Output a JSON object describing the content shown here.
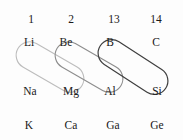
{
  "figure": {
    "background_color": "#fdfdfd",
    "text_color": "#202020"
  },
  "groups": [
    {
      "label": "1",
      "x": 31,
      "y": 20
    },
    {
      "label": "2",
      "x": 71,
      "y": 20
    },
    {
      "label": "13",
      "x": 114,
      "y": 20
    },
    {
      "label": "14",
      "x": 156,
      "y": 20
    }
  ],
  "elements": [
    {
      "symbol": "Li",
      "x": 29,
      "y": 43,
      "group": "1",
      "period": "2"
    },
    {
      "symbol": "Be",
      "x": 66,
      "y": 43,
      "group": "2",
      "period": "2"
    },
    {
      "symbol": "B",
      "x": 110,
      "y": 43,
      "group": "13",
      "period": "2"
    },
    {
      "symbol": "C",
      "x": 156,
      "y": 43,
      "group": "14",
      "period": "2"
    },
    {
      "symbol": "Na",
      "x": 30,
      "y": 92,
      "group": "1",
      "period": "3"
    },
    {
      "symbol": "Mg",
      "x": 71,
      "y": 92,
      "group": "2",
      "period": "3"
    },
    {
      "symbol": "Al",
      "x": 110,
      "y": 92,
      "group": "13",
      "period": "3"
    },
    {
      "symbol": "Si",
      "x": 157,
      "y": 92,
      "group": "14",
      "period": "3"
    },
    {
      "symbol": "K",
      "x": 29,
      "y": 126,
      "group": "1",
      "period": "4"
    },
    {
      "symbol": "Ca",
      "x": 71,
      "y": 126,
      "group": "2",
      "period": "4"
    },
    {
      "symbol": "Ga",
      "x": 113,
      "y": 126,
      "group": "13",
      "period": "4"
    },
    {
      "symbol": "Ge",
      "x": 157,
      "y": 126,
      "group": "14",
      "period": "4"
    }
  ],
  "capsules": [
    {
      "name": "li-mg",
      "pair": "Li-Mg",
      "from": "Li",
      "to": "Mg",
      "stroke": "#bdbdbd",
      "stroke_width": 1.1,
      "cx": 50,
      "cy": 67,
      "length": 74,
      "thickness": 27,
      "angle": 30
    },
    {
      "name": "be-al",
      "pair": "Be-Al",
      "from": "Be",
      "to": "Al",
      "stroke": "#8d8d8d",
      "stroke_width": 1.1,
      "cx": 89,
      "cy": 67,
      "length": 74,
      "thickness": 27,
      "angle": 30
    },
    {
      "name": "b-si",
      "pair": "B-Si",
      "from": "B",
      "to": "Si",
      "stroke": "#3f3f3f",
      "stroke_width": 1.2,
      "cx": 133,
      "cy": 67,
      "length": 78,
      "thickness": 27,
      "angle": 33
    }
  ]
}
